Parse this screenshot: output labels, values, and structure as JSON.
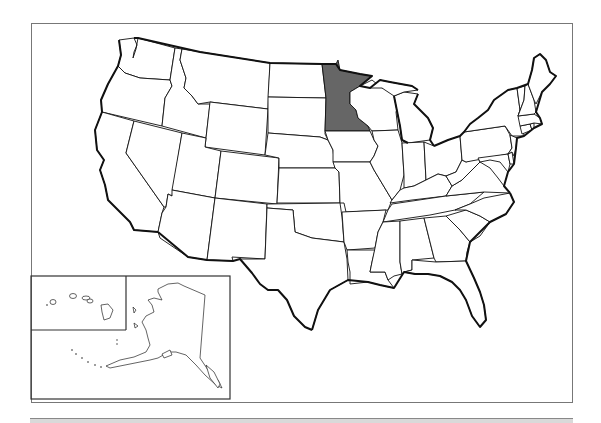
{
  "map": {
    "title": "United States map",
    "highlighted_state": "Minnesota",
    "highlight_color": "#666666",
    "default_fill": "#ffffff",
    "outline_color": "#111111",
    "states": [
      "Washington",
      "Oregon",
      "California",
      "Idaho",
      "Nevada",
      "Montana",
      "Wyoming",
      "Utah",
      "Arizona",
      "Colorado",
      "New Mexico",
      "North Dakota",
      "South Dakota",
      "Nebraska",
      "Kansas",
      "Oklahoma",
      "Texas",
      "Minnesota",
      "Iowa",
      "Missouri",
      "Arkansas",
      "Louisiana",
      "Wisconsin",
      "Illinois",
      "Michigan",
      "Indiana",
      "Ohio",
      "Kentucky",
      "Tennessee",
      "Mississippi",
      "Alabama",
      "Georgia",
      "Florida",
      "South Carolina",
      "North Carolina",
      "Virginia",
      "West Virginia",
      "Pennsylvania",
      "New York",
      "Maryland",
      "Delaware",
      "New Jersey",
      "Connecticut",
      "Rhode Island",
      "Massachusetts",
      "Vermont",
      "New Hampshire",
      "Maine"
    ],
    "insets": [
      "Alaska",
      "Hawaii"
    ]
  }
}
